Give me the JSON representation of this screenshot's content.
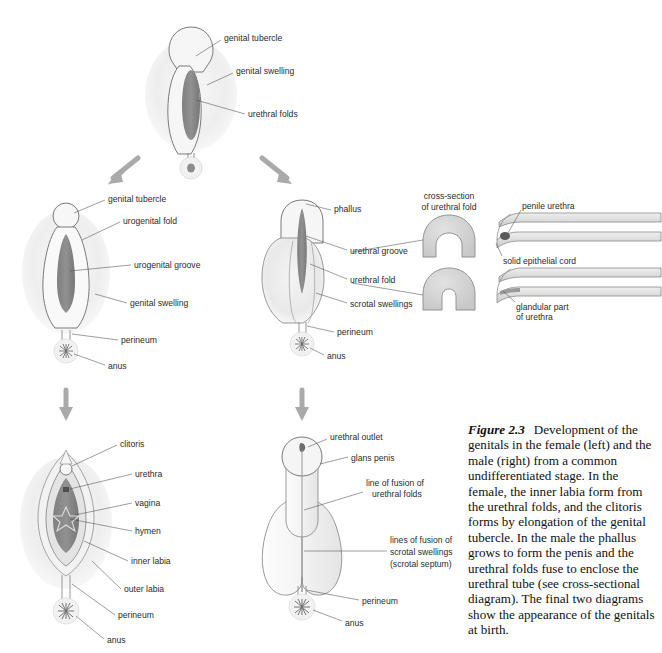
{
  "figure": {
    "number": "Figure 2.3",
    "caption": "Development of the genitals in the female (left) and the male (right) from a common undifferentiated stage. In the female, the inner labia form from the urethral folds, and the clitoris forms by elongation of the genital tubercle. In the male the phallus grows to form the penis and the urethral folds fuse to enclose the urethral tube (see cross-sectional diagram). The final two diagrams show the appearance of the genitals at birth."
  },
  "palette": {
    "outline": "#6e6e6e",
    "fill_pale": "#f2f2f2",
    "fill_mid": "#d9d9d9",
    "fill_dark": "#8a8a8a",
    "arrow": "#a8a8a8",
    "leader": "#4d4d4d",
    "text": "#2b2b2b"
  },
  "panels": {
    "undifferentiated": {
      "name": "undifferentiated stage",
      "labels": [
        {
          "text": "genital tubercle",
          "x": 224,
          "y": 38
        },
        {
          "text": "genital swelling",
          "x": 236,
          "y": 71
        },
        {
          "text": "urethral folds",
          "x": 248,
          "y": 115
        }
      ]
    },
    "female_intermediate": {
      "name": "female intermediate stage",
      "labels": [
        {
          "text": "genital tubercle",
          "x": 108,
          "y": 199
        },
        {
          "text": "urogenital fold",
          "x": 123,
          "y": 221
        },
        {
          "text": "urogenital groove",
          "x": 134,
          "y": 266
        },
        {
          "text": "genital swelling",
          "x": 130,
          "y": 304
        },
        {
          "text": "perineum",
          "x": 121,
          "y": 341
        },
        {
          "text": "anus",
          "x": 108,
          "y": 367
        }
      ]
    },
    "male_intermediate": {
      "name": "male intermediate stage",
      "labels": [
        {
          "text": "phallus",
          "x": 334,
          "y": 209
        },
        {
          "text": "urethral groove",
          "x": 350,
          "y": 252
        },
        {
          "text": "urethral fold",
          "x": 350,
          "y": 281
        },
        {
          "text": "scrotal swellings",
          "x": 350,
          "y": 305
        },
        {
          "text": "perineum",
          "x": 337,
          "y": 333
        },
        {
          "text": "anus",
          "x": 327,
          "y": 357
        }
      ]
    },
    "cross_section": {
      "title_line1": "cross-section",
      "title_line2": "of urethral fold",
      "title_x": 449,
      "title_y1": 197,
      "title_y2": 208
    },
    "urethra_formation": {
      "labels": [
        {
          "text": "penile urethra",
          "x": 522,
          "y": 207
        },
        {
          "text": "solid epithelial cord",
          "x": 503,
          "y": 262
        },
        {
          "text": "glandular part",
          "x": 516,
          "y": 308
        },
        {
          "text": "of urethra",
          "x": 516,
          "y": 318
        }
      ]
    },
    "female_final": {
      "name": "female at birth",
      "labels": [
        {
          "text": "clitoris",
          "x": 120,
          "y": 444
        },
        {
          "text": "urethra",
          "x": 135,
          "y": 475
        },
        {
          "text": "vagina",
          "x": 135,
          "y": 504
        },
        {
          "text": "hymen",
          "x": 135,
          "y": 532
        },
        {
          "text": "inner labia",
          "x": 131,
          "y": 562
        },
        {
          "text": "outer labia",
          "x": 124,
          "y": 590
        },
        {
          "text": "perineum",
          "x": 118,
          "y": 616
        },
        {
          "text": "anus",
          "x": 107,
          "y": 641
        }
      ]
    },
    "male_final": {
      "name": "male at birth",
      "labels": [
        {
          "text": "urethral outlet",
          "x": 330,
          "y": 437
        },
        {
          "text": "glans penis",
          "x": 351,
          "y": 458
        },
        {
          "text": "line of fusion of",
          "x": 366,
          "y": 483
        },
        {
          "text": "urethral folds",
          "x": 372,
          "y": 494
        },
        {
          "text": "lines of fusion of",
          "x": 390,
          "y": 540
        },
        {
          "text": "scrotal swellings",
          "x": 390,
          "y": 552
        },
        {
          "text": "(scrotal septum)",
          "x": 390,
          "y": 564
        },
        {
          "text": "perineum",
          "x": 362,
          "y": 601
        },
        {
          "text": "anus",
          "x": 345,
          "y": 623
        }
      ]
    }
  }
}
